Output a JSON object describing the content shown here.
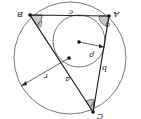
{
  "diagram": {
    "orientation": "rotated 180 degrees",
    "colors": {
      "stroke": "#222222",
      "angle_fill": "#c8c8c8",
      "background": "#ffffff",
      "circle": "#555555"
    },
    "circumcircle": {
      "cx": 70,
      "cy": 58,
      "r": 56,
      "radius_label": "r"
    },
    "incircle": {
      "cx": 79,
      "cy": 41,
      "r": 26,
      "radius_label": "ρ"
    },
    "vertices": {
      "A": {
        "label": "A",
        "x": 109,
        "y": 16
      },
      "B": {
        "label": "B",
        "x": 30,
        "y": 15
      },
      "C": {
        "label": "C",
        "x": 93,
        "y": 112
      }
    },
    "sides": {
      "a": "a",
      "b": "b",
      "c": "c"
    },
    "angles": {
      "alpha": "α",
      "beta": "β",
      "gamma": "γ"
    }
  }
}
